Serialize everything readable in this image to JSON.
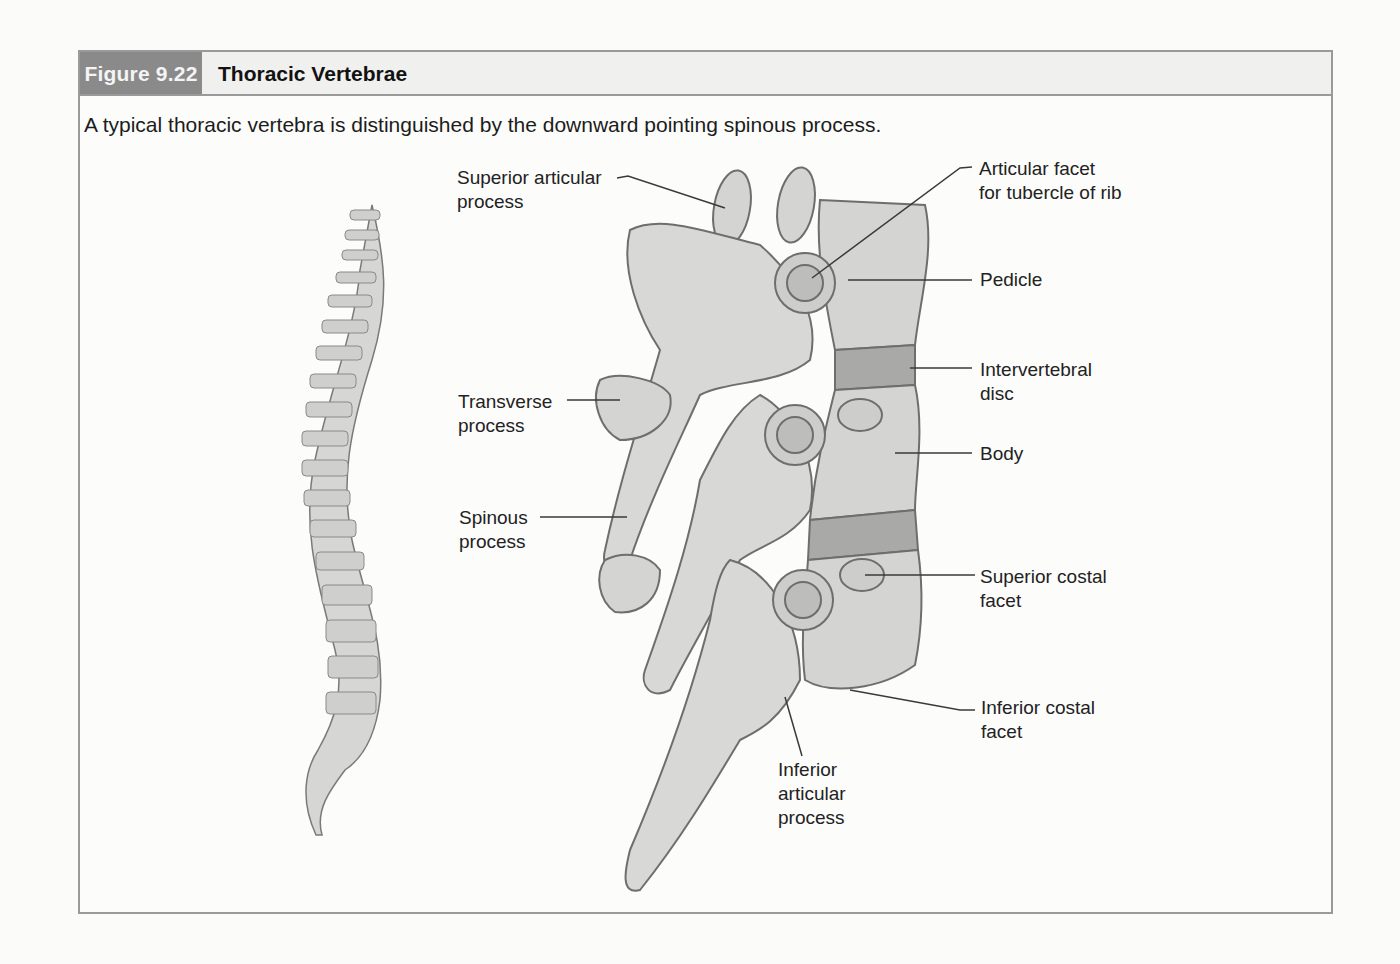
{
  "figure": {
    "number": "Figure 9.22",
    "title": "Thoracic Vertebrae",
    "caption": "A typical thoracic vertebra is distinguished by the downward pointing spinous process."
  },
  "colors": {
    "header_tag_bg": "#8a8a8a",
    "header_bg": "#f0f0ef",
    "border": "#9a9a9a",
    "bone_fill": "#d4d4d2",
    "bone_stroke": "#6e6e6e",
    "disc_fill": "#a9a9a7"
  },
  "labels": {
    "superior_articular_process": "Superior articular\nprocess",
    "transverse_process": "Transverse\nprocess",
    "spinous_process": "Spinous\nprocess",
    "articular_facet_tubercle": "Articular facet\nfor tubercle of rib",
    "pedicle": "Pedicle",
    "intervertebral_disc": "Intervertebral\ndisc",
    "body": "Body",
    "superior_costal_facet": "Superior costal\nfacet",
    "inferior_costal_facet": "Inferior costal\nfacet",
    "inferior_articular_process": "Inferior\narticular\nprocess"
  },
  "illustrations": {
    "spine": "vertebral-column-lateral-view",
    "vertebrae": "thoracic-vertebrae-lateral-view"
  }
}
